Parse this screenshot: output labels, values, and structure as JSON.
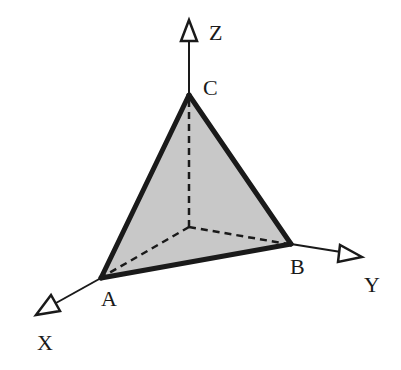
{
  "diagram": {
    "type": "3d-coordinate-tetrahedron",
    "colors": {
      "background": "#ffffff",
      "face_fill": "#c8c8c8",
      "stroke": "#1a1a1a"
    },
    "axes": {
      "x": {
        "label": "X"
      },
      "y": {
        "label": "Y"
      },
      "z": {
        "label": "Z"
      }
    },
    "vertices": {
      "a": {
        "label": "A",
        "on_axis": "X"
      },
      "b": {
        "label": "B",
        "on_axis": "Y"
      },
      "c": {
        "label": "C",
        "on_axis": "Z"
      }
    },
    "edges": {
      "visible_solid": [
        "AB",
        "BC",
        "CA"
      ],
      "hidden_dashed": [
        "OA",
        "OB",
        "OC"
      ]
    }
  }
}
